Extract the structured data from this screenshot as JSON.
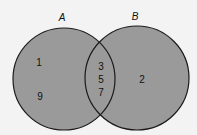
{
  "diagram": {
    "type": "venn",
    "sets": [
      {
        "name": "A",
        "label": "A",
        "only_elements": [
          "1",
          "9"
        ]
      },
      {
        "name": "B",
        "label": "B",
        "only_elements": [
          "2"
        ]
      }
    ],
    "intersection": {
      "sets": [
        "A",
        "B"
      ],
      "elements": [
        "3",
        "5",
        "7"
      ]
    },
    "colors": {
      "fill": "#9a9a9a",
      "stroke": "#1a1a1a",
      "background": "#f3f3f3"
    }
  }
}
